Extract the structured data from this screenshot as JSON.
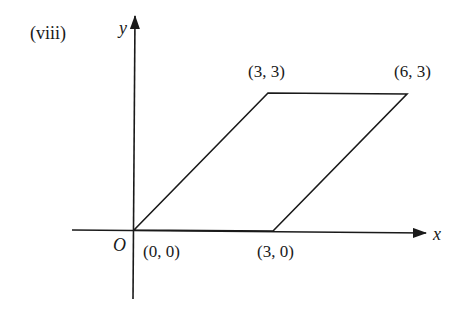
{
  "figure": {
    "label": "(viii)"
  },
  "axes": {
    "x_label": "x",
    "y_label": "y",
    "origin_label": "O"
  },
  "vertices": [
    {
      "label": "(0, 0)",
      "x": 0,
      "y": 0
    },
    {
      "label": "(3, 3)",
      "x": 3,
      "y": 3
    },
    {
      "label": "(6, 3)",
      "x": 6,
      "y": 3
    },
    {
      "label": "(3, 0)",
      "x": 3,
      "y": 0
    }
  ],
  "shape": {
    "type": "parallelogram",
    "stroke_color": "#1a1a1a"
  }
}
